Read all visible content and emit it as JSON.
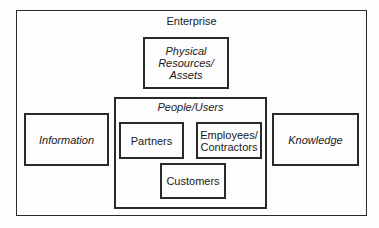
{
  "diagram": {
    "enterprise": {
      "label": "Enterprise"
    },
    "physical_resources": {
      "label_lines": [
        "Physical",
        "Resources/",
        "Assets"
      ]
    },
    "information": {
      "label": "Information"
    },
    "knowledge": {
      "label": "Knowledge"
    },
    "people_users": {
      "label": "People/Users",
      "partners": {
        "label": "Partners"
      },
      "employees_contractors": {
        "label_lines": [
          "Employees/",
          "Contractors"
        ]
      },
      "customers": {
        "label": "Customers"
      }
    }
  }
}
